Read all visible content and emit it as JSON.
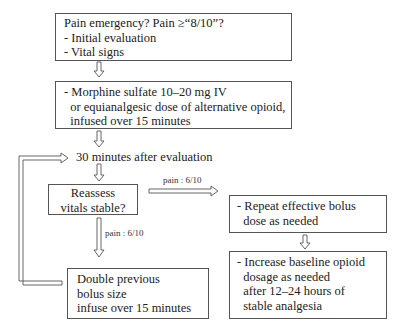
{
  "flowchart": {
    "nodes": {
      "start": {
        "lines": [
          "Pain emergency?  Pain ≥“8/10”?",
          "- Initial evaluation",
          "- Vital signs"
        ]
      },
      "morphine": {
        "lines": [
          "- Morphine sulfate 10–20 mg IV",
          "  or equianalgesic dose of alternative opioid,",
          "  infused over 15 minutes"
        ]
      },
      "wait": {
        "text": "30 minutes after evaluation"
      },
      "reassess": {
        "lines": [
          "Reassess",
          "vitals stable?"
        ]
      },
      "repeat": {
        "lines": [
          "- Repeat effective bolus",
          "  dose as needed"
        ]
      },
      "increase": {
        "lines": [
          "- Increase baseline opioid",
          "  dosage as needed",
          "  after 12–24 hours of",
          "  stable analgesia"
        ]
      },
      "double": {
        "lines": [
          "Double previous",
          "bolus size",
          "infuse over 15 minutes"
        ]
      }
    },
    "edge_labels": {
      "reassess_to_repeat": "pain : 6/10",
      "reassess_to_double": "pain : 6/10"
    },
    "colors": {
      "border": "#555555",
      "arrow": "#555555",
      "text": "#222222",
      "background": "#ffffff"
    }
  }
}
